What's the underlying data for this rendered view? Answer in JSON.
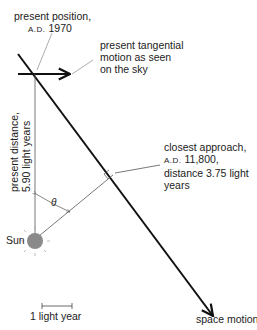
{
  "labels": {
    "present_position_line1": "present position,",
    "present_position_era": "A.D.",
    "present_position_year": "1970",
    "tangential_line1": "present tangential",
    "tangential_line2": "motion as seen",
    "tangential_line3": "on the sky",
    "present_distance_line1": "present distance,",
    "present_distance_line2": "5.90 light years",
    "closest_line1": "closest approach,",
    "closest_era": "A.D.",
    "closest_year": "11,800,",
    "closest_line3": "distance 3.75 light",
    "closest_line4": "years",
    "theta": "θ",
    "sun": "Sun",
    "scale": "1 light year",
    "space_motion": "space motion"
  },
  "colors": {
    "line": "#111111",
    "thin_line": "#555555",
    "sun_fill": "#8a8a8a",
    "text": "#222222"
  },
  "geometry": {
    "present_distance_ly": 5.9,
    "closest_distance_ly": 3.75,
    "closest_year": "A.D. 11,800",
    "present_year": "A.D. 1970"
  }
}
